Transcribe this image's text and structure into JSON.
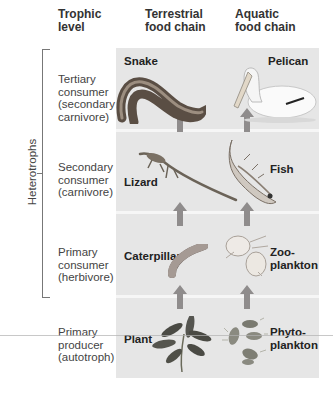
{
  "headers": {
    "trophic_level": [
      "Trophic",
      "level"
    ],
    "terrestrial": [
      "Terrestrial",
      "food chain"
    ],
    "aquatic": [
      "Aquatic",
      "food chain"
    ]
  },
  "group_label": "Heterotrophs",
  "levels": [
    {
      "lines": [
        "Tertiary",
        "consumer",
        "(secondary",
        "carnivore)"
      ],
      "terrestrial": "Snake",
      "aquatic": "Pelican"
    },
    {
      "lines": [
        "Secondary",
        "consumer",
        "(carnivore)"
      ],
      "terrestrial": "Lizard",
      "aquatic": "Fish"
    },
    {
      "lines": [
        "Primary",
        "consumer",
        "(herbivore)"
      ],
      "terrestrial": "Caterpillar",
      "aquatic": [
        "Zoo-",
        "plankton"
      ]
    },
    {
      "lines": [
        "Primary",
        "producer",
        "(autotroph)"
      ],
      "terrestrial": "Plant",
      "aquatic": [
        "Phyto-",
        "plankton"
      ]
    }
  ],
  "colors": {
    "panel": "#e6e6e6",
    "arrow": "#8f8c8c",
    "divider": "#f6f6f6"
  }
}
